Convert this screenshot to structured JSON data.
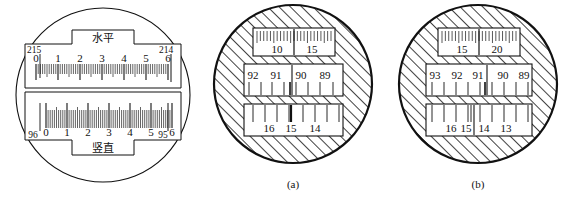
{
  "figure": {
    "title": "",
    "background": "#ffffff",
    "ink": "#111111"
  },
  "panels": [
    {
      "id": "panel-left",
      "caption": "",
      "type": "scale-reading-window-plain",
      "windows": [
        {
          "id": "horizontal-window",
          "label": "水平",
          "label_position": "top",
          "left_value": "215",
          "right_value": "214",
          "ticks_direction": "down",
          "numbers": [
            "0",
            "1",
            "2",
            "3",
            "4",
            "5",
            "6"
          ]
        },
        {
          "id": "vertical-window",
          "label": "竖直",
          "label_position": "bottom",
          "left_value": "96",
          "right_value": "95",
          "ticks_direction": "up",
          "numbers": [
            "0",
            "1",
            "2",
            "3",
            "4",
            "5",
            "6"
          ]
        }
      ]
    },
    {
      "id": "panel-a",
      "caption": "(a)",
      "type": "hatched-circle-three-windows",
      "windows": [
        {
          "id": "a-top-window",
          "position": "top",
          "numbers": [
            "10",
            "15"
          ],
          "numbers_position": "below",
          "ticks": "fine",
          "index_line": true
        },
        {
          "id": "a-middle-window",
          "position": "middle",
          "numbers": [
            "92",
            "91",
            "90",
            "89"
          ],
          "numbers_position": "above",
          "ticks": "coarse-down",
          "divider_after_index": 1
        },
        {
          "id": "a-bottom-window",
          "position": "bottom",
          "numbers": [
            "16",
            "15",
            "14"
          ],
          "numbers_position": "below",
          "ticks": "coarse-up",
          "index_line": true
        }
      ]
    },
    {
      "id": "panel-b",
      "caption": "(b)",
      "type": "hatched-circle-three-windows",
      "windows": [
        {
          "id": "b-top-window",
          "position": "top",
          "numbers": [
            "15",
            "20"
          ],
          "numbers_position": "below",
          "ticks": "fine",
          "index_line": true
        },
        {
          "id": "b-middle-window",
          "position": "middle",
          "numbers": [
            "93",
            "92",
            "91",
            "90",
            "89"
          ],
          "numbers_position": "above",
          "ticks": "coarse-down",
          "divider_after_index": 2
        },
        {
          "id": "b-bottom-window",
          "position": "bottom",
          "numbers": [
            "16",
            "15",
            "14",
            "13"
          ],
          "numbers_position": "below",
          "ticks": "coarse-up",
          "divider_after_index": 1
        }
      ]
    }
  ]
}
